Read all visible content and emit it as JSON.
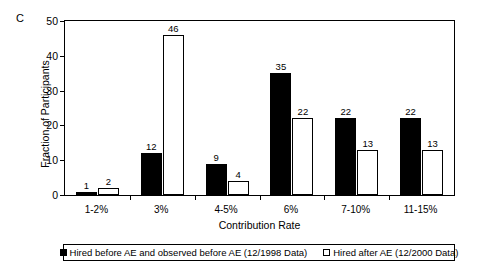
{
  "panel": {
    "label": "C"
  },
  "chart_data": {
    "type": "bar",
    "title": "",
    "panel_label": "C",
    "xlabel": "Contribution Rate",
    "ylabel": "Fraction of Participants",
    "ylim": [
      0,
      50
    ],
    "yticks": [
      0,
      10,
      20,
      30,
      40,
      50
    ],
    "grid": false,
    "legend_position": "bottom",
    "categories": [
      "1-2%",
      "3%",
      "4-5%",
      "6%",
      "7-10%",
      "11-15%"
    ],
    "series": [
      {
        "name": "Hired before AE and observed before AE (12/1998 Data)",
        "style": "filled",
        "values": [
          1,
          12,
          9,
          35,
          22,
          22
        ]
      },
      {
        "name": "Hired after AE (12/2000 Data)",
        "style": "hollow",
        "values": [
          2,
          46,
          4,
          22,
          13,
          13
        ]
      }
    ]
  }
}
